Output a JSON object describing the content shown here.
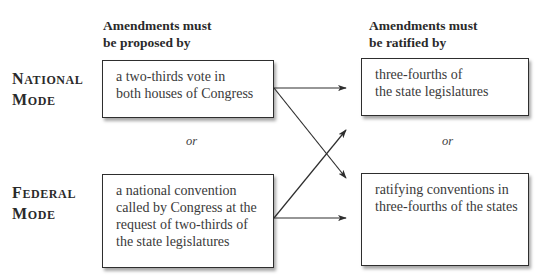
{
  "headers": {
    "proposed": [
      "Amendments must",
      "be proposed by"
    ],
    "ratified": [
      "Amendments must",
      "be ratified by"
    ]
  },
  "modes": [
    {
      "id": "national",
      "label_line1_cap": "N",
      "label_line1_rest": "ational",
      "label_line2_cap": "M",
      "label_line2_rest": "ode",
      "proposal_box": [
        "a two-thirds vote in",
        "both houses of Congress"
      ]
    },
    {
      "id": "federal",
      "label_line1_cap": "F",
      "label_line1_rest": "ederal",
      "label_line2_cap": "M",
      "label_line2_rest": "ode",
      "proposal_box": [
        "a national convention",
        "called by Congress at the",
        "request of two-thirds of",
        "the state legislatures"
      ]
    }
  ],
  "ratification_boxes": [
    [
      "three-fourths of",
      "the state legislatures"
    ],
    [
      "ratifying conventions in",
      "three-fourths of the states"
    ]
  ],
  "separators": {
    "left": "or",
    "right": "or"
  },
  "arrows": [
    {
      "from": "national",
      "to": "state-legislatures"
    },
    {
      "from": "national",
      "to": "ratifying-conventions"
    },
    {
      "from": "federal",
      "to": "state-legislatures"
    },
    {
      "from": "federal",
      "to": "ratifying-conventions"
    }
  ],
  "colors": {
    "line": "#2e2e2e",
    "text": "#3a3a3a",
    "background": "#ffffff"
  }
}
